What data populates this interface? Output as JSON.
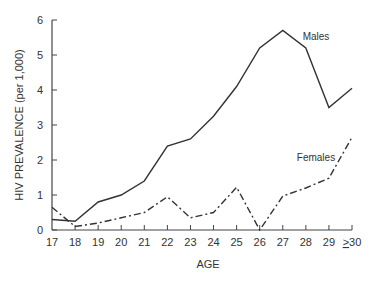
{
  "chart_data": {
    "type": "line",
    "title": "",
    "xlabel": "AGE",
    "ylabel": "HIV PREVALENCE (per 1,000)",
    "categories": [
      "17",
      "18",
      "19",
      "20",
      "21",
      "22",
      "23",
      "24",
      "25",
      "26",
      "27",
      "28",
      "29",
      "≥30"
    ],
    "series": [
      {
        "name": "Males",
        "style": "solid",
        "values": [
          0.3,
          0.25,
          0.8,
          1.0,
          1.4,
          2.4,
          2.6,
          3.25,
          4.1,
          5.2,
          5.7,
          5.2,
          3.5,
          4.05
        ]
      },
      {
        "name": "Females",
        "style": "dash-dot",
        "values": [
          0.65,
          0.1,
          0.2,
          0.35,
          0.5,
          0.95,
          0.35,
          0.5,
          1.22,
          0.0,
          0.97,
          1.2,
          1.48,
          2.65
        ]
      }
    ],
    "ylim": [
      0,
      6
    ],
    "yticks": [
      0,
      1,
      2,
      3,
      4,
      5,
      6
    ],
    "grid": false,
    "legend": "inline labels",
    "annotations": [
      {
        "text": "Males",
        "near": "28"
      },
      {
        "text": "Females",
        "near": "29"
      }
    ]
  },
  "labels": {
    "x_axis_title": "AGE",
    "y_axis_title": "HIV PREVALENCE (per 1,000)",
    "males": "Males",
    "females": "Females"
  },
  "colors": {
    "line": "#333333",
    "axis": "#444444",
    "text": "#333333"
  }
}
